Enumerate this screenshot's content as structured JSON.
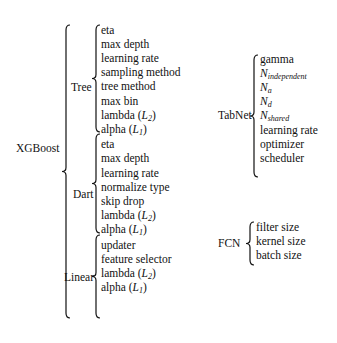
{
  "diagram": {
    "type": "hyperparameter-tree",
    "models": [
      {
        "name": "XGBoost",
        "boosters": [
          {
            "name": "Tree",
            "params": [
              {
                "text": "eta"
              },
              {
                "text": "max depth"
              },
              {
                "text": "learning rate"
              },
              {
                "text": "sampling method"
              },
              {
                "text": "tree method"
              },
              {
                "text": "max bin"
              },
              {
                "text": "lambda (",
                "math": "L",
                "sub": "2",
                "tail": ")"
              },
              {
                "text": "alpha (",
                "math": "L",
                "sub": "1",
                "tail": ")"
              }
            ]
          },
          {
            "name": "Dart",
            "params": [
              {
                "text": "eta"
              },
              {
                "text": "max depth"
              },
              {
                "text": "learning rate"
              },
              {
                "text": "normalize type"
              },
              {
                "text": "skip drop"
              },
              {
                "text": "lambda (",
                "math": "L",
                "sub": "2",
                "tail": ")"
              },
              {
                "text": "alpha (",
                "math": "L",
                "sub": "1",
                "tail": ")"
              }
            ]
          },
          {
            "name": "Linear",
            "params": [
              {
                "text": "updater"
              },
              {
                "text": "feature selector"
              },
              {
                "text": "lambda (",
                "math": "L",
                "sub": "2",
                "tail": ")"
              },
              {
                "text": "alpha (",
                "math": "L",
                "sub": "1",
                "tail": ")"
              }
            ]
          }
        ]
      },
      {
        "name": "TabNet",
        "params": [
          {
            "text": "gamma"
          },
          {
            "text": "",
            "math": "N",
            "sub": "independent",
            "tail": ""
          },
          {
            "text": "",
            "math": "N",
            "sub": "a",
            "tail": ""
          },
          {
            "text": "",
            "math": "N",
            "sub": "d",
            "tail": ""
          },
          {
            "text": "",
            "math": "N",
            "sub": "shared",
            "tail": ""
          },
          {
            "text": "learning rate"
          },
          {
            "text": "optimizer"
          },
          {
            "text": "scheduler"
          }
        ]
      },
      {
        "name": "FCN",
        "params": [
          {
            "text": "filter size"
          },
          {
            "text": "kernel size"
          },
          {
            "text": "batch size"
          }
        ]
      }
    ]
  }
}
